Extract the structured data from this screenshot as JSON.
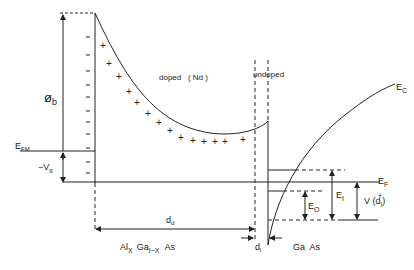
{
  "diagram": {
    "labels": {
      "phi_b": "ø",
      "phi_b_sub": "b",
      "efm": "E",
      "efm_sub": "FM",
      "vg": "−V",
      "vg_sub": "g",
      "doped": "doped   ( Nd )",
      "undoped": "undoped",
      "ec": "E",
      "ec_sub": "C",
      "ef": "E",
      "ef_sub": "F",
      "e0": "E",
      "e0_sub": "O",
      "e1": "E",
      "e1_sub": "I",
      "v": "V (d",
      "v_sub": "i",
      "v_sup": "+",
      "v_end": ")",
      "dd": "d",
      "dd_sub": "d",
      "di": "d",
      "di_sub": "i",
      "algaas_a": "Al",
      "algaas_x": "X",
      "algaas_b": "Ga",
      "algaas_1x": "I−X",
      "algaas_c": "As",
      "gaas": "Ga  As"
    },
    "colors": {
      "line": "#222222",
      "background": "#ffffff"
    }
  }
}
